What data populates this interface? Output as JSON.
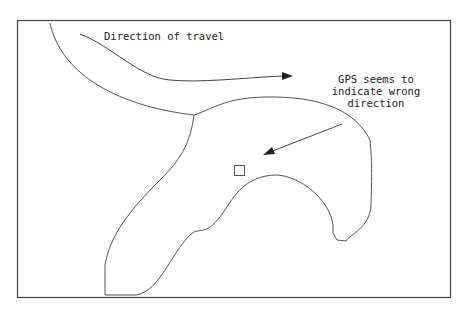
{
  "diagram": {
    "labels": {
      "direction_of_travel": "Direction of travel",
      "gps_note": {
        "line1": "GPS seems to",
        "line2": "indicate wrong",
        "line3": "direction"
      }
    },
    "colors": {
      "stroke": "#555555",
      "frame": "#444444",
      "background": "#ffffff",
      "text": "#222222"
    },
    "elements": [
      "frame",
      "road-outline",
      "travel-direction-arrow",
      "gps-pointer-arrow",
      "gps-position-marker"
    ]
  }
}
